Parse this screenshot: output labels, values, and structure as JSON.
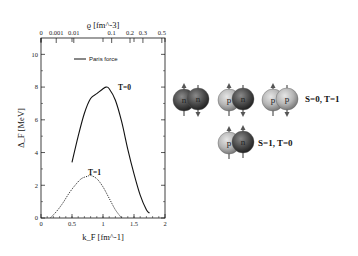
{
  "chart_data": {
    "type": "line",
    "title": "",
    "xlabel": "k_F [fm^-1]",
    "ylabel": "Δ_F [MeV]",
    "top_xlabel": "ϱ [fm^-3]",
    "xlim": [
      0,
      2
    ],
    "ylim": [
      0,
      11
    ],
    "x_ticks": [
      "0",
      "0.5",
      "1",
      "1.5",
      "2"
    ],
    "y_ticks": [
      "0",
      "2",
      "4",
      "6",
      "8",
      "10"
    ],
    "top_x_ticks": [
      "0",
      "0.001",
      "0.01",
      "0.1",
      "0.2",
      "0.3",
      "0.5"
    ],
    "grid": false,
    "legend": {
      "position": "upper-left",
      "entries": [
        "Paris force"
      ]
    },
    "series": [
      {
        "name": "T=0",
        "style": "solid",
        "x": [
          0.5,
          0.6,
          0.7,
          0.8,
          0.9,
          1.0,
          1.05,
          1.1,
          1.2,
          1.3,
          1.4,
          1.5,
          1.6,
          1.7,
          1.75
        ],
        "y": [
          3.4,
          5.0,
          6.4,
          7.3,
          7.6,
          7.9,
          8.0,
          7.9,
          7.2,
          5.9,
          4.2,
          2.7,
          1.4,
          0.5,
          0.3
        ]
      },
      {
        "name": "T=1",
        "style": "dotted",
        "x": [
          0.15,
          0.25,
          0.35,
          0.45,
          0.55,
          0.65,
          0.75,
          0.8,
          0.9,
          1.0,
          1.1,
          1.2,
          1.3
        ],
        "y": [
          0.0,
          0.4,
          0.9,
          1.5,
          2.0,
          2.4,
          2.55,
          2.6,
          2.4,
          1.9,
          1.2,
          0.5,
          0.0
        ]
      }
    ],
    "annotations": [
      "T=0",
      "T=1"
    ]
  },
  "diagram": {
    "row1": {
      "pairs": [
        {
          "left": "n",
          "right": "n"
        },
        {
          "left": "p",
          "right": "n"
        },
        {
          "left": "p",
          "right": "p"
        }
      ],
      "label": "S=0, T=1"
    },
    "row2": {
      "pairs": [
        {
          "left": "p",
          "right": "n"
        }
      ],
      "label": "S=1, T=0"
    }
  },
  "colors": {
    "proton": "#b8b8b8",
    "neutron": "#4a4a4a",
    "line": "#111111"
  }
}
